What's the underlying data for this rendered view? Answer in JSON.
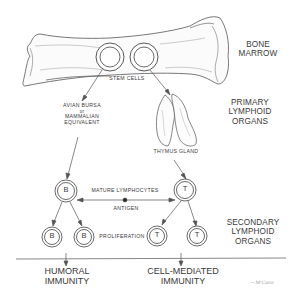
{
  "diagram": {
    "type": "immune-system-lymphocyte-development",
    "stages": {
      "bone_marrow": {
        "label_line1": "BONE",
        "label_line2": "MARROW"
      },
      "primary": {
        "line1": "PRIMARY",
        "line2": "LYMPHOID",
        "line3": "ORGANS"
      },
      "secondary": {
        "line1": "SECONDARY",
        "line2": "LYMPHOID",
        "line3": "ORGANS"
      }
    },
    "stem_cells_label": "STEM   CELLS",
    "bursa": {
      "line1": "AVIAN BURSA",
      "line2": "or",
      "line3": "MAMMALIAN",
      "line4": "EQUIVALENT"
    },
    "thymus_label": "THYMUS GLAND",
    "mature_label": "MATURE  LYMPHOCYTES",
    "antigen_label": "ANTIGEN",
    "proliferation_label": "PROLIFERATION",
    "cells": {
      "b_mature": "B",
      "t_mature": "T",
      "b_child_1": "B",
      "b_child_2": "B",
      "t_child_1": "T",
      "t_child_2": "T"
    },
    "outcomes": {
      "humoral": {
        "line1": "HUMORAL",
        "line2": "IMMUNITY"
      },
      "cell_mediated": {
        "line1": "CELL-MEDIATED",
        "line2": "IMMUNITY"
      }
    },
    "signature": "→ MᶜCann",
    "colors": {
      "ink": "#3a3a3a",
      "bone_shade": "#8a8a8a",
      "background": "#ffffff"
    }
  }
}
